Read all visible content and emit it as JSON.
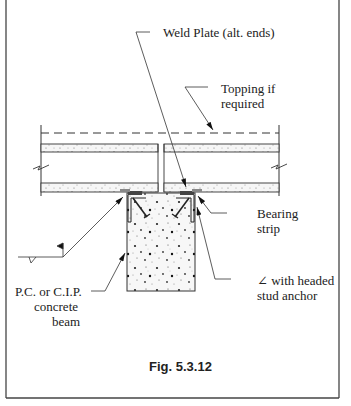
{
  "figure": {
    "caption": "Fig. 5.3.12",
    "labels": {
      "weld_plate": "Weld Plate (alt. ends)",
      "topping_line1": "Topping if",
      "topping_line2": "required",
      "bearing_line1": "Bearing",
      "bearing_line2": "strip",
      "angle_symbol": "∠",
      "angle_line1": " with headed",
      "angle_line2": "stud anchor",
      "beam_line1": "P.C. or C.I.P.",
      "beam_line2": "concrete",
      "beam_line3": "beam"
    },
    "colors": {
      "line": "#333333",
      "frame": "#444444",
      "concrete_fill": "#f4f4f4"
    }
  }
}
